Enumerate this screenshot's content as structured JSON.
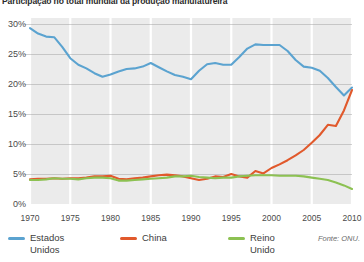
{
  "title": "Participação no total mundial da produção manufatureira",
  "source_note": "Fonte: ONU.",
  "axis": {
    "y_ticks": [
      "0%",
      "5%",
      "10%",
      "15%",
      "20%",
      "25%",
      "30%"
    ],
    "x_ticks": [
      "1970",
      "1975",
      "1980",
      "1985",
      "1990",
      "1995",
      "2000",
      "2005",
      "2010"
    ]
  },
  "legend": {
    "items": [
      {
        "label": "Estados Unidos",
        "color": "#5ba3d0"
      },
      {
        "label": "China",
        "color": "#e1592c"
      },
      {
        "label": "Reino Unido",
        "color": "#8cc152"
      }
    ]
  },
  "colors": {
    "plot_background": "#ebebeb",
    "grid_horizontal": "#9a9a9a",
    "grid_vertical": "#ffffff",
    "page_background": "#ffffff",
    "text": "#3a3a3a"
  },
  "chart_data": {
    "type": "line",
    "title": "Participação no total mundial da produção manufatureira",
    "xlabel": "",
    "ylabel": "",
    "xlim": [
      1970,
      2010
    ],
    "ylim": [
      0,
      31
    ],
    "ytick_values": [
      0,
      5,
      10,
      15,
      20,
      25,
      30
    ],
    "xtick_values": [
      1970,
      1975,
      1980,
      1985,
      1990,
      1995,
      2000,
      2005,
      2010
    ],
    "grid": "horizontal gray lines at every 5%, white vertical lines at every 5 years",
    "legend_position": "below-left",
    "unit": "percent",
    "x": [
      1970,
      1971,
      1972,
      1973,
      1974,
      1975,
      1976,
      1977,
      1978,
      1979,
      1980,
      1981,
      1982,
      1983,
      1984,
      1985,
      1986,
      1987,
      1988,
      1989,
      1990,
      1991,
      1992,
      1993,
      1994,
      1995,
      1996,
      1997,
      1998,
      1999,
      2000,
      2001,
      2002,
      2003,
      2004,
      2005,
      2006,
      2007,
      2008,
      2009,
      2010
    ],
    "series": [
      {
        "name": "Estados Unidos",
        "color": "#5ba3d0",
        "values": [
          29.3,
          28.4,
          27.9,
          27.8,
          26.2,
          24.3,
          23.2,
          22.6,
          21.8,
          21.2,
          21.6,
          22.1,
          22.5,
          22.6,
          22.9,
          23.5,
          22.8,
          22.1,
          21.5,
          21.2,
          20.8,
          22.2,
          23.3,
          23.5,
          23.2,
          23.2,
          24.5,
          25.9,
          26.6,
          26.5,
          26.5,
          26.5,
          25.5,
          24.0,
          22.9,
          22.7,
          22.2,
          21.0,
          19.5,
          18.1,
          19.4
        ]
      },
      {
        "name": "China",
        "color": "#e1592c",
        "values": [
          4.1,
          4.2,
          4.2,
          4.3,
          4.2,
          4.3,
          4.3,
          4.4,
          4.6,
          4.6,
          4.7,
          4.2,
          4.1,
          4.3,
          4.4,
          4.6,
          4.8,
          4.9,
          4.8,
          4.6,
          4.3,
          4.0,
          4.2,
          4.6,
          4.5,
          5.0,
          4.6,
          4.4,
          5.5,
          5.1,
          6.0,
          6.6,
          7.3,
          8.1,
          9.0,
          10.2,
          11.5,
          13.2,
          13.0,
          15.6,
          19.0
        ]
      },
      {
        "name": "Reino Unido",
        "color": "#8cc152",
        "values": [
          4.0,
          4.0,
          4.1,
          4.3,
          4.2,
          4.2,
          4.1,
          4.3,
          4.4,
          4.4,
          4.3,
          3.9,
          3.9,
          4.0,
          4.1,
          4.2,
          4.3,
          4.4,
          4.6,
          4.6,
          4.7,
          4.5,
          4.4,
          4.3,
          4.4,
          4.4,
          4.6,
          4.7,
          4.8,
          4.8,
          4.8,
          4.7,
          4.7,
          4.7,
          4.6,
          4.4,
          4.2,
          4.0,
          3.6,
          3.1,
          2.5
        ]
      }
    ]
  }
}
